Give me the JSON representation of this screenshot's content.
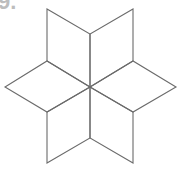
{
  "problem": {
    "number_label": "9."
  },
  "figure": {
    "stroke_color": "#6b6b6b",
    "center": [
      90,
      87
    ],
    "rhombi": [
      {
        "name": "top-left",
        "points": "90,87 90,34 47,9 47,61"
      },
      {
        "name": "top-right",
        "points": "90,87 90,34 133,9 133,61"
      },
      {
        "name": "right",
        "points": "90,87 133,61 176,87 133,112"
      },
      {
        "name": "bottom-right",
        "points": "90,87 133,112 133,163 90,138"
      },
      {
        "name": "bottom-left",
        "points": "90,87 90,138 47,163 47,112"
      },
      {
        "name": "left",
        "points": "90,87 47,112 5,87 47,61"
      }
    ]
  }
}
